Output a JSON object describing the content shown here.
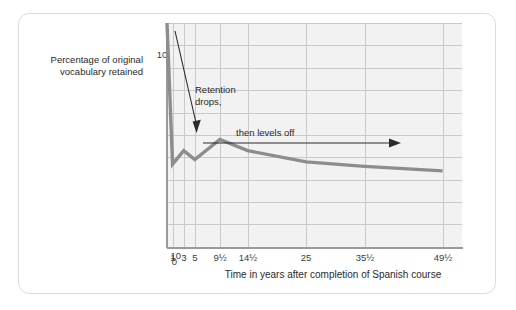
{
  "figure": {
    "y_axis_title": "Percentage of original vocabulary retained",
    "x_axis_title": "Time in years after completion of Spanish course",
    "annotation_1": "Retention drops,",
    "annotation_1_line1": "Retention",
    "annotation_1_line2": "drops,",
    "annotation_2": "then levels off"
  },
  "chart_data": {
    "type": "line",
    "title": "",
    "subtitle": "",
    "xlabel": "Time in years after completion of Spanish course",
    "ylabel": "Percentage of original vocabulary retained",
    "x_tick_labels": [
      "1",
      "3",
      "5",
      "9½",
      "14½",
      "25",
      "35½",
      "49½"
    ],
    "x_tick_values": [
      1,
      3,
      5,
      9.5,
      14.5,
      25,
      35.5,
      49.5
    ],
    "y_tick_labels": [
      "0",
      "10",
      "20",
      "30",
      "40",
      "50",
      "60",
      "70",
      "80",
      "90",
      "100%"
    ],
    "y_tick_values": [
      0,
      10,
      20,
      30,
      40,
      50,
      60,
      70,
      80,
      90,
      100
    ],
    "ylim": [
      0,
      100
    ],
    "xlim": [
      0,
      53
    ],
    "grid": true,
    "legend": "none",
    "series": [
      {
        "name": "Percentage of original vocabulary retained",
        "color": "#8d8d8d",
        "x": [
          0,
          1,
          3,
          5,
          9.5,
          14.5,
          25,
          35.5,
          49.5
        ],
        "values": [
          100,
          37,
          43,
          39,
          48,
          43,
          38,
          36,
          34
        ]
      }
    ],
    "annotations": [
      {
        "text": "Retention drops,",
        "kind": "arrow-label",
        "arrow_from_x": 1.1,
        "arrow_from_y": 97,
        "arrow_to_x": 3.2,
        "arrow_to_y": 54
      },
      {
        "text": "then levels off",
        "kind": "arrow-label",
        "arrow_from_x": 6.5,
        "arrow_from_y": 58,
        "arrow_to_x": 41,
        "arrow_to_y": 58
      }
    ]
  },
  "colors": {
    "plot_background": "#f2f2f2",
    "gridline": "#c9c9c9",
    "axis": "#9a9a9a",
    "data_line": "#8d8d8d",
    "annotation": "#2a2a2a",
    "card_border": "#dcdcdc"
  }
}
